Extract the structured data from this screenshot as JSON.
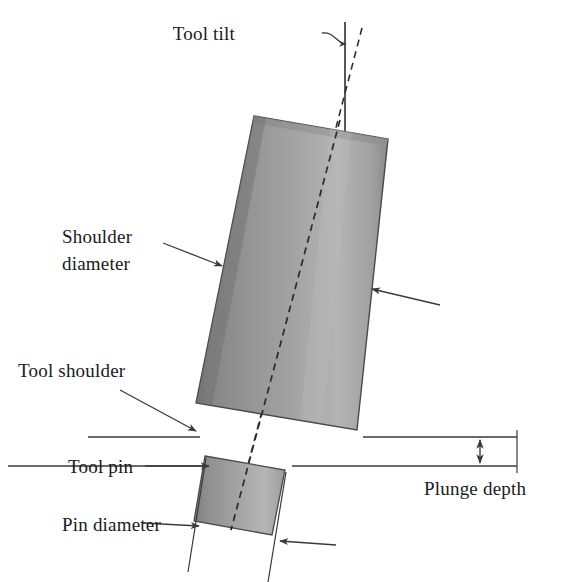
{
  "figure": {
    "kind": "technical-diagram",
    "background_color": "#ffffff",
    "line_color": "#3a3a3a",
    "text_color": "#1a1a1a"
  },
  "labels": {
    "tool_tilt": "Tool tilt",
    "shoulder_diameter_line1": "Shoulder",
    "shoulder_diameter_line2": "diameter",
    "tool_shoulder": "Tool shoulder",
    "tool_pin": "Tool pin",
    "pin_diameter": "Pin diameter",
    "plunge_depth": "Plunge depth"
  },
  "colors": {
    "shoulder_edge_dark": "#7e7e7e",
    "shoulder_mid": "#9a9a9a",
    "shoulder_light": "#b8b8b8",
    "shoulder_right_dark": "#8c8c8c",
    "pin_dark": "#808080",
    "pin_mid": "#9e9e9e",
    "pin_light": "#bcbcbc",
    "top_face": "#8f8f8f",
    "outline": "#4a4a4a",
    "dimension_line": "#3a3a3a",
    "dashed_axis": "#2e2e2e"
  },
  "geometry": {
    "tilt_degrees": 8,
    "shoulder": {
      "top_left": [
        254,
        116
      ],
      "top_right": [
        388,
        139
      ],
      "bottom_right": [
        357,
        430
      ],
      "bottom_left": [
        196,
        403
      ]
    },
    "pin": {
      "top_left": [
        205,
        456
      ],
      "top_right": [
        285,
        470
      ],
      "bottom_right": [
        272,
        535
      ],
      "bottom_left": [
        194,
        521
      ]
    },
    "workpiece_top_line_y": 437,
    "workpiece_bottom_line_y": 466,
    "vertical_reference_line_x": 345,
    "plunge_arrow_x": 480
  }
}
